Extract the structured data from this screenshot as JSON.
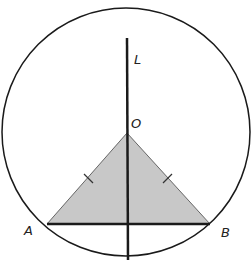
{
  "diagram": {
    "title": "",
    "circle": {
      "cx": 126,
      "cy": 132,
      "r": 124,
      "stroke": "#1a1a1a"
    },
    "line_L": {
      "x": 127,
      "y1": 38,
      "y2": 260,
      "label": "L",
      "label_x": 134,
      "label_y": 64
    },
    "points": {
      "O": {
        "x": 127,
        "y": 133,
        "label": "O",
        "label_x": 131,
        "label_y": 128
      },
      "A": {
        "x": 47,
        "y": 224,
        "label": "A",
        "label_x": 24,
        "label_y": 235
      },
      "B": {
        "x": 210,
        "y": 224,
        "label": "B",
        "label_x": 221,
        "label_y": 237
      }
    },
    "triangle": {
      "fill": "#c8c8c8",
      "stroke": "#555555",
      "vertices": [
        "O",
        "A",
        "B"
      ]
    },
    "segment_AB": {
      "stroke": "#1a1a1a",
      "width": 2.5
    },
    "tick_marks": [
      "OA",
      "OB"
    ]
  }
}
